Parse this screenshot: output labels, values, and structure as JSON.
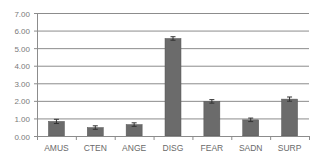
{
  "chart_data": {
    "type": "bar",
    "title": "",
    "xlabel": "",
    "ylabel": "",
    "categories": [
      "AMUS",
      "CTEN",
      "ANGE",
      "DISG",
      "FEAR",
      "SADN",
      "SURP"
    ],
    "values": [
      0.83,
      0.48,
      0.65,
      5.55,
      1.97,
      0.92,
      2.1
    ],
    "error": [
      0.12,
      0.1,
      0.1,
      0.1,
      0.1,
      0.1,
      0.12
    ],
    "ylim": [
      0,
      7
    ],
    "yticks": [
      "0.00",
      "1.00",
      "2.00",
      "3.00",
      "4.00",
      "5.00",
      "6.00",
      "7.00"
    ],
    "grid": true,
    "legend": null,
    "colors": {
      "bar": "#6b6b6b",
      "bar_edge": "#555555",
      "grid": "#8c8c8c",
      "axis": "#8c8c8c",
      "error_bar": "#333333"
    }
  }
}
